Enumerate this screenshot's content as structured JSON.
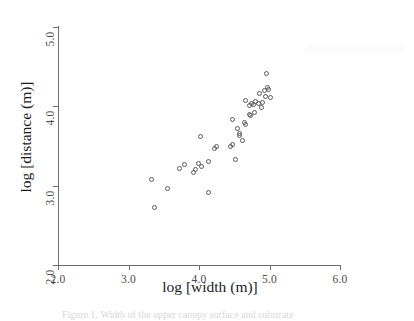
{
  "figure": {
    "caption": "Figure 1. Width of the upper canopy surface and substrate",
    "background_color": "#ffffff",
    "marker_color": "#5a5a5a",
    "axis_color": "#6c6c6c"
  },
  "chart_data": {
    "type": "scatter",
    "title": "",
    "xlabel": "log [width (m)]",
    "ylabel": "log [distance (m)]",
    "xlim": [
      2.0,
      6.0
    ],
    "ylim": [
      2.0,
      5.0
    ],
    "xticks": [
      "2.0",
      "3.0",
      "4.0",
      "5.0",
      "6.0"
    ],
    "yticks": [
      "2.0",
      "3.0",
      "4.0",
      "5.0"
    ],
    "xtick_values": [
      2.0,
      3.0,
      4.0,
      5.0,
      6.0
    ],
    "ytick_values": [
      2.0,
      3.0,
      4.0,
      5.0
    ],
    "grid": false,
    "legend": "none",
    "marker": "open-circle",
    "n_points": 42,
    "points": [
      {
        "x": 3.37,
        "y": 2.72
      },
      {
        "x": 3.32,
        "y": 3.08
      },
      {
        "x": 3.56,
        "y": 2.96
      },
      {
        "x": 3.72,
        "y": 3.22
      },
      {
        "x": 3.8,
        "y": 3.27
      },
      {
        "x": 3.92,
        "y": 3.16
      },
      {
        "x": 3.95,
        "y": 3.21
      },
      {
        "x": 3.99,
        "y": 3.28
      },
      {
        "x": 4.04,
        "y": 3.24
      },
      {
        "x": 4.02,
        "y": 3.62
      },
      {
        "x": 4.13,
        "y": 3.3
      },
      {
        "x": 4.22,
        "y": 3.47
      },
      {
        "x": 4.25,
        "y": 3.49
      },
      {
        "x": 4.14,
        "y": 2.91
      },
      {
        "x": 4.44,
        "y": 3.5
      },
      {
        "x": 4.47,
        "y": 3.52
      },
      {
        "x": 4.52,
        "y": 3.33
      },
      {
        "x": 4.55,
        "y": 3.72
      },
      {
        "x": 4.58,
        "y": 3.63
      },
      {
        "x": 4.57,
        "y": 3.66
      },
      {
        "x": 4.62,
        "y": 3.57
      },
      {
        "x": 4.48,
        "y": 3.83
      },
      {
        "x": 4.64,
        "y": 3.79
      },
      {
        "x": 4.66,
        "y": 3.77
      },
      {
        "x": 4.71,
        "y": 3.9
      },
      {
        "x": 4.73,
        "y": 3.88
      },
      {
        "x": 4.72,
        "y": 4.01
      },
      {
        "x": 4.74,
        "y": 4.04
      },
      {
        "x": 4.78,
        "y": 4.02
      },
      {
        "x": 4.8,
        "y": 4.06
      },
      {
        "x": 4.84,
        "y": 4.03
      },
      {
        "x": 4.66,
        "y": 4.07
      },
      {
        "x": 4.88,
        "y": 3.98
      },
      {
        "x": 4.9,
        "y": 4.05
      },
      {
        "x": 4.86,
        "y": 4.16
      },
      {
        "x": 4.93,
        "y": 4.2
      },
      {
        "x": 4.97,
        "y": 4.24
      },
      {
        "x": 4.99,
        "y": 4.21
      },
      {
        "x": 4.95,
        "y": 4.13
      },
      {
        "x": 5.02,
        "y": 4.11
      },
      {
        "x": 4.96,
        "y": 4.41
      },
      {
        "x": 4.79,
        "y": 3.92
      }
    ]
  }
}
